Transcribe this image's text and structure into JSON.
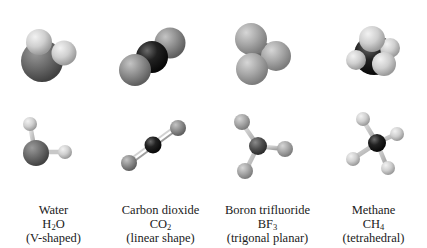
{
  "molecules": [
    {
      "name": "Water",
      "formula_base": "H",
      "formula_sub": "2",
      "formula_tail": "O",
      "shape": "(V-shaped)",
      "center_atom": "O",
      "center_color": "#6e6e6e",
      "outer_atom": "H",
      "outer_color": "#d8d8d8"
    },
    {
      "name": "Carbon dioxide",
      "formula_base": "CO",
      "formula_sub": "2",
      "formula_tail": "",
      "shape": "(linear shape)",
      "center_atom": "C",
      "center_color": "#1e1e1e",
      "outer_atom": "O",
      "outer_color": "#8a8a8a"
    },
    {
      "name": "Boron trifluoride",
      "formula_base": "BF",
      "formula_sub": "3",
      "formula_tail": "",
      "shape": "(trigonal planar)",
      "center_atom": "B",
      "center_color": "#4a4a4a",
      "outer_atom": "F",
      "outer_color": "#a8a8a8"
    },
    {
      "name": "Methane",
      "formula_base": "CH",
      "formula_sub": "4",
      "formula_tail": "",
      "shape": "(tetrahedral)",
      "center_atom": "C",
      "center_color": "#151515",
      "outer_atom": "H",
      "outer_color": "#d4d4d4"
    }
  ]
}
